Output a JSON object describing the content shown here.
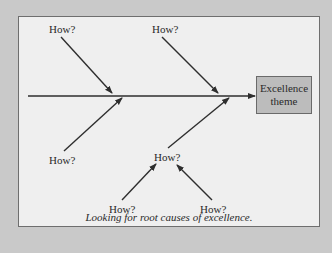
{
  "diagram": {
    "type": "fishbone",
    "effect_box": {
      "line1": "Excellence",
      "line2": "theme",
      "fill": "#bcbcbc"
    },
    "labels": {
      "top_left": "How?",
      "top_right": "How?",
      "bottom_left": "How?",
      "bottom_middle": "How?",
      "sub_left": "How?",
      "sub_right": "How?"
    },
    "caption": "Looking for root causes of excellence.",
    "colors": {
      "background": "#c9c9c9",
      "panel": "#efefef",
      "line": "#2e2e2e"
    }
  }
}
